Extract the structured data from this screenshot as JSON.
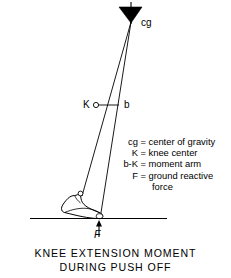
{
  "figure": {
    "stroke_color": "#000000",
    "fill_color": "#000000",
    "background_color": "#ffffff",
    "markers": {
      "cg": "cg",
      "knee": "K",
      "moment_point": "b",
      "force": "F"
    },
    "geometry": {
      "cg_apex": [
        131,
        22
      ],
      "knee_point": [
        97,
        107
      ],
      "b_point": [
        117,
        107
      ],
      "ankle_point": [
        82,
        196
      ],
      "toe_ground_point": [
        100,
        218
      ],
      "ground_line_y": 218,
      "ground_line_x1": 30,
      "ground_line_x2": 167,
      "force_arrow_from": [
        99,
        237
      ],
      "force_arrow_to": [
        99,
        221
      ]
    }
  },
  "legend": {
    "rows": [
      {
        "symbol": "cg",
        "equals": "=",
        "definition": "center of gravity"
      },
      {
        "symbol": "K",
        "equals": "=",
        "definition": "knee center"
      },
      {
        "symbol": "b-K",
        "equals": "=",
        "definition": "moment arm"
      },
      {
        "symbol": "F",
        "equals": "=",
        "definition": "ground reactive"
      }
    ],
    "continuation": "force"
  },
  "caption": {
    "line1": "KNEE EXTENSION MOMENT",
    "line2": "DURING PUSH OFF"
  }
}
